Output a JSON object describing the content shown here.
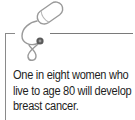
{
  "callout": {
    "icon": "stethoscope-icon",
    "text": "One in eight women who live to age 80 will develop breast cancer.",
    "colors": {
      "rule": "#8a8a8a",
      "icon_stroke": "#9a9a9a",
      "chestpiece": "#555555",
      "text": "#1e1e1e"
    }
  }
}
